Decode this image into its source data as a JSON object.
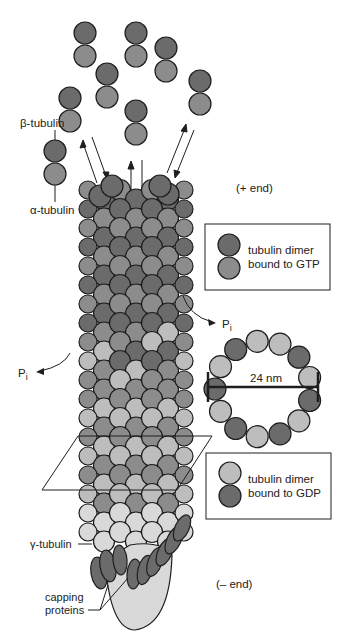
{
  "diagram": {
    "labels": {
      "beta_tubulin": "β-tubulin",
      "alpha_tubulin": "α-tubulin",
      "plus_end": "(+ end)",
      "minus_end": "(– end)",
      "pi_right": "P",
      "pi_right_sub": "i",
      "pi_left": "P",
      "pi_left_sub": "i",
      "diameter": "24 nm",
      "gamma_tubulin": "γ-tubulin",
      "capping_line1": "capping",
      "capping_line2": "proteins"
    },
    "legend": [
      {
        "line1": "tubulin dimer",
        "line2": "bound to GTP",
        "top_color": "#6b6b6b",
        "bottom_color": "#8c8c8c"
      },
      {
        "line1": "tubulin dimer",
        "line2": "bound to GDP",
        "top_color": "#bdbdbd",
        "bottom_color": "#6b6b6b"
      }
    ],
    "colors": {
      "gtp_beta": "#6b6b6b",
      "gtp_alpha": "#8c8c8c",
      "gdp_beta": "#bdbdbd",
      "gdp_alpha": "#6b6b6b",
      "cap": "#d9d9d9",
      "outline": "#1e1e1e"
    },
    "ring": {
      "protofilament_count": 13
    }
  }
}
